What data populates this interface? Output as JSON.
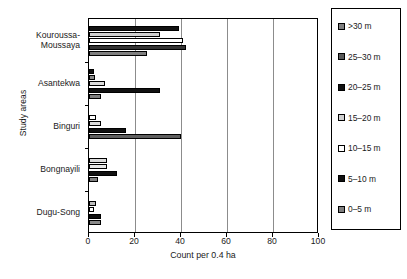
{
  "chart_data": {
    "type": "bar",
    "orientation": "horizontal",
    "title": "",
    "xlabel": "Count per 0.4 ha",
    "ylabel": "Study areas",
    "xlim": [
      0,
      100
    ],
    "xticks": [
      0,
      20,
      40,
      60,
      80,
      100
    ],
    "grid": true,
    "legend_position": "right",
    "categories": [
      "Kouroussa-\nMoussaya",
      "Asantekwa",
      "Binguri",
      "Bongnayili",
      "Dugu-Song"
    ],
    "series": [
      {
        "name": ">30 m",
        "color": "#7f7f7f",
        "values": [
          25,
          4,
          1,
          1,
          2
        ]
      },
      {
        "name": "25–30 m",
        "color": "#595959",
        "values": [
          42,
          31,
          40,
          12,
          5
        ]
      },
      {
        "name": "20–25 m",
        "color": "#111111",
        "values": [
          41,
          1,
          0.5,
          1,
          1
        ]
      },
      {
        "name": "15–20 m",
        "color": "#cfcfcf",
        "values": [
          31,
          7,
          5,
          8,
          3
        ]
      },
      {
        "name": "10–15 m",
        "color": "#ffffff",
        "values": [
          39,
          4,
          3,
          8,
          1
        ]
      },
      {
        "name": "5–10 m",
        "color": "#111111",
        "values": [
          39,
          2,
          1,
          0.5,
          0
        ]
      },
      {
        "name": "0–5 m",
        "color": "#7f7f7f",
        "values": [
          0,
          0,
          0,
          0,
          0
        ]
      }
    ],
    "legend_entries": [
      {
        "label": ">30 m",
        "color": "#7f7f7f"
      },
      {
        "label": "25–30 m",
        "color": "#595959"
      },
      {
        "label": "20–25 m",
        "color": "#111111"
      },
      {
        "label": "15–20 m",
        "color": "#cfcfcf"
      },
      {
        "label": "10–15 m",
        "color": "#ffffff"
      },
      {
        "label": "5–10 m",
        "color": "#111111"
      },
      {
        "label": "0–5 m",
        "color": "#7f7f7f"
      }
    ],
    "bars": [
      {
        "group": 0,
        "series": "20–25 m",
        "value": 39,
        "color": "#111111"
      },
      {
        "group": 0,
        "series": "15–20 m",
        "value": 31,
        "color": "#cfcfcf"
      },
      {
        "group": 0,
        "series": "10–15 m",
        "value": 41,
        "color": "#ffffff"
      },
      {
        "group": 0,
        "series": "25–30 m",
        "value": 42,
        "color": "#333333"
      },
      {
        "group": 0,
        "series": ">30 m",
        "value": 25,
        "color": "#7f7f7f"
      },
      {
        "group": 1,
        "series": "5–10 m",
        "value": 2,
        "color": "#111111"
      },
      {
        "group": 1,
        "series": "20–25 m",
        "value": 2.5,
        "color": "#8a8a8a"
      },
      {
        "group": 1,
        "series": "15–20 m",
        "value": 7,
        "color": "#dcdcdc"
      },
      {
        "group": 1,
        "series": "25–30 m",
        "value": 31,
        "color": "#111111"
      },
      {
        "group": 1,
        "series": ">30 m",
        "value": 5,
        "color": "#7f7f7f"
      },
      {
        "group": 2,
        "series": "10–15 m",
        "value": 3,
        "color": "#ffffff"
      },
      {
        "group": 2,
        "series": "15–20 m",
        "value": 5,
        "color": "#dcdcdc"
      },
      {
        "group": 2,
        "series": "20–25 m",
        "value": 16,
        "color": "#111111"
      },
      {
        "group": 2,
        "series": "25–30 m",
        "value": 40,
        "color": "#5f5f5f"
      },
      {
        "group": 3,
        "series": "15–20 m",
        "value": 8,
        "color": "#dcdcdc"
      },
      {
        "group": 3,
        "series": "10–15 m",
        "value": 8,
        "color": "#e8e8e8"
      },
      {
        "group": 3,
        "series": "25–30 m",
        "value": 12,
        "color": "#111111"
      },
      {
        "group": 3,
        "series": ">30 m",
        "value": 4,
        "color": "#7f7f7f"
      },
      {
        "group": 4,
        "series": "15–20 m",
        "value": 3,
        "color": "#bdbdbd"
      },
      {
        "group": 4,
        "series": "10–15 m",
        "value": 2,
        "color": "#ffffff"
      },
      {
        "group": 4,
        "series": "25–30 m",
        "value": 5,
        "color": "#111111"
      },
      {
        "group": 4,
        "series": ">30 m",
        "value": 5,
        "color": "#8a8a8a"
      }
    ]
  }
}
